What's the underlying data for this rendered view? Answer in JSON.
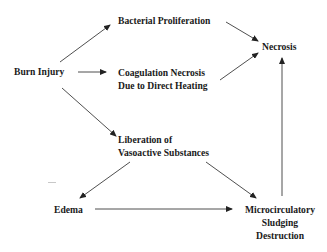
{
  "diagram": {
    "type": "flowchart",
    "nodes": {
      "burn_injury": {
        "label": "Burn Injury"
      },
      "bacterial": {
        "label": "Bacterial Proliferation"
      },
      "coagulation": {
        "line1": "Coagulation Necrosis",
        "line2": "Due to Direct Heating"
      },
      "necrosis": {
        "label": "Necrosis"
      },
      "liberation": {
        "line1": "Liberation of",
        "line2": "Vasoactive Substances"
      },
      "edema": {
        "label": "Edema"
      },
      "micro": {
        "line1": "Microcirculatory",
        "line2": "Sludging",
        "line3": "Destruction"
      }
    },
    "edges": [
      {
        "from": "Burn Injury",
        "to": "Bacterial Proliferation"
      },
      {
        "from": "Burn Injury",
        "to": "Coagulation Necrosis Due to Direct Heating"
      },
      {
        "from": "Burn Injury",
        "to": "Liberation of Vasoactive Substances"
      },
      {
        "from": "Bacterial Proliferation",
        "to": "Necrosis"
      },
      {
        "from": "Coagulation Necrosis Due to Direct Heating",
        "to": "Necrosis"
      },
      {
        "from": "Liberation of Vasoactive Substances",
        "to": "Edema"
      },
      {
        "from": "Liberation of Vasoactive Substances",
        "to": "Microcirculatory Sludging Destruction"
      },
      {
        "from": "Edema",
        "to": "Microcirculatory Sludging Destruction"
      },
      {
        "from": "Microcirculatory Sludging Destruction",
        "to": "Necrosis"
      }
    ],
    "colors": {
      "text": "#1a1a1a",
      "line": "#222222",
      "background": "#ffffff"
    }
  }
}
